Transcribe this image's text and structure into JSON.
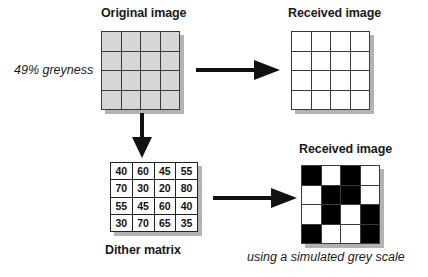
{
  "labels": {
    "original_image": "Original image",
    "received_image_top": "Received image",
    "received_image_bottom": "Received image",
    "greyness": "49% greyness",
    "dither_matrix": "Dither matrix",
    "simulated_grey_scale": "using a simulated grey scale"
  },
  "colors": {
    "grey_cell": "#d6d6d6",
    "white_cell": "#ffffff",
    "black_cell": "#000000",
    "border": "#3a3a3a",
    "shadow": "#b3b3b3",
    "text": "#1a1a1a"
  },
  "original_grid": {
    "rows": 4,
    "cols": 4,
    "cells": [
      [
        "grey",
        "grey",
        "grey",
        "grey"
      ],
      [
        "grey",
        "grey",
        "grey",
        "grey"
      ],
      [
        "grey",
        "grey",
        "grey",
        "grey"
      ],
      [
        "grey",
        "grey",
        "grey",
        "grey"
      ]
    ]
  },
  "received_grid_top": {
    "rows": 4,
    "cols": 4,
    "cells": [
      [
        "white",
        "white",
        "white",
        "white"
      ],
      [
        "white",
        "white",
        "white",
        "white"
      ],
      [
        "white",
        "white",
        "white",
        "white"
      ],
      [
        "white",
        "white",
        "white",
        "white"
      ]
    ]
  },
  "dither_matrix": {
    "rows": 4,
    "cols": 4,
    "values": [
      [
        40,
        60,
        45,
        55
      ],
      [
        70,
        30,
        20,
        80
      ],
      [
        55,
        45,
        60,
        40
      ],
      [
        30,
        70,
        65,
        35
      ]
    ]
  },
  "received_grid_bottom": {
    "rows": 4,
    "cols": 4,
    "threshold": 49,
    "cells": [
      [
        "black",
        "white",
        "black",
        "white"
      ],
      [
        "white",
        "black",
        "black",
        "white"
      ],
      [
        "white",
        "black",
        "white",
        "black"
      ],
      [
        "black",
        "white",
        "white",
        "black"
      ]
    ]
  },
  "arrows": [
    {
      "name": "arrow-original-to-received",
      "direction": "right"
    },
    {
      "name": "arrow-original-to-dither",
      "direction": "down"
    },
    {
      "name": "arrow-dither-to-received",
      "direction": "right"
    }
  ]
}
